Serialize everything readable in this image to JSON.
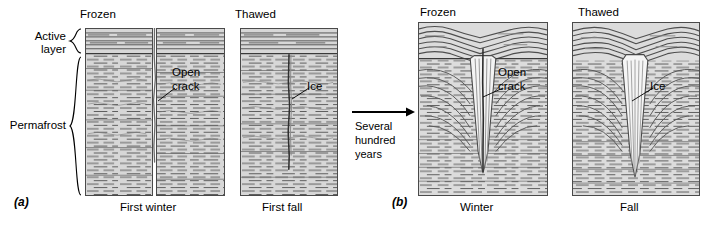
{
  "figure": {
    "type": "geologic-cross-section-diagram",
    "background": "#ffffff",
    "ink_color": "#000000",
    "ground_fill": "#d5d5d5",
    "ice_fill": "#f2f2f2"
  },
  "side_labels": {
    "active_layer": "Active\nlayer",
    "permafrost": "Permafrost"
  },
  "panel_a": {
    "id": "(a)",
    "headers": {
      "frozen": "Frozen",
      "thawed": "Thawed"
    },
    "footers": {
      "first_winter": "First winter",
      "first_fall": "First fall"
    },
    "callouts": {
      "open_crack": "Open\ncrack",
      "ice": "Ice"
    }
  },
  "transition": {
    "arrow": "right-arrow",
    "caption": "Several\nhundred\nyears"
  },
  "panel_b": {
    "id": "(b)",
    "headers": {
      "frozen": "Frozen",
      "thawed": "Thawed"
    },
    "footers": {
      "winter": "Winter",
      "fall": "Fall"
    },
    "callouts": {
      "open_crack": "Open\ncrack",
      "ice": "Ice"
    }
  }
}
